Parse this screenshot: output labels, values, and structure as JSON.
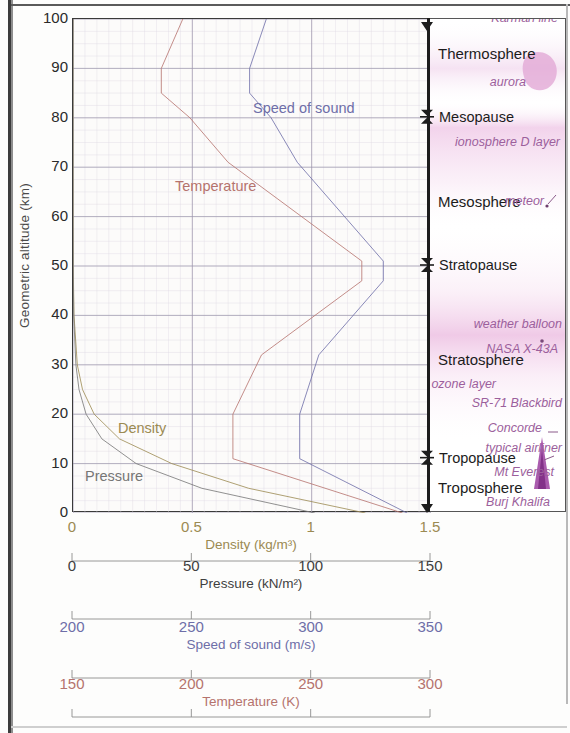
{
  "chart_data": {
    "type": "line",
    "title": "",
    "ylabel": "Geometric altitude (km)",
    "ylim": [
      0,
      100
    ],
    "yticks": [
      0,
      10,
      20,
      30,
      40,
      50,
      60,
      70,
      80,
      90,
      100
    ],
    "grid": true,
    "orientation": "y-is-altitude",
    "legend_position": "in-plot-inline-labels",
    "axes": [
      {
        "name": "density",
        "label": "Density (kg/m³)",
        "ticks": [
          "0",
          "0.5",
          "1",
          "1.5"
        ],
        "tick_values": [
          0,
          0.5,
          1,
          1.5
        ],
        "range": [
          0,
          1.5
        ],
        "color": "#9b8a52"
      },
      {
        "name": "pressure",
        "label": "Pressure (kN/m²)",
        "ticks": [
          "0",
          "50",
          "100",
          "150"
        ],
        "tick_values": [
          0,
          50,
          100,
          150
        ],
        "range": [
          0,
          150
        ],
        "color": "#4a4a4a"
      },
      {
        "name": "speed_of_sound",
        "label": "Speed of sound (m/s)",
        "ticks": [
          "200",
          "250",
          "300",
          "350"
        ],
        "tick_values": [
          200,
          250,
          300,
          350
        ],
        "range": [
          200,
          350
        ],
        "color": "#6e6ea8"
      },
      {
        "name": "temperature",
        "label": "Temperature (K)",
        "ticks": [
          "150",
          "200",
          "250",
          "300"
        ],
        "tick_values": [
          150,
          200,
          250,
          300
        ],
        "range": [
          150,
          300
        ],
        "color": "#b5736d"
      }
    ],
    "series": [
      {
        "name": "Temperature",
        "label": "Temperature",
        "color": "#b5736d",
        "axis": "temperature",
        "unit": "K",
        "altitude_km": [
          0,
          11,
          20,
          32,
          47,
          51,
          71,
          80,
          85,
          90,
          100
        ],
        "values": [
          288,
          217,
          217,
          229,
          271,
          271,
          215,
          199,
          187,
          187,
          196
        ]
      },
      {
        "name": "Speed of sound",
        "label": "Speed of sound",
        "color": "#6e6ea8",
        "axis": "speed_of_sound",
        "unit": "m/s",
        "altitude_km": [
          0,
          11,
          20,
          32,
          47,
          51,
          71,
          80,
          85,
          90,
          100
        ],
        "values": [
          340,
          295,
          295,
          303,
          330,
          330,
          294,
          283,
          274,
          274,
          281
        ]
      },
      {
        "name": "Density",
        "label": "Density",
        "color": "#9b8a52",
        "axis": "density",
        "unit": "kg/m³",
        "altitude_km": [
          0,
          5,
          10,
          15,
          20,
          25,
          30,
          40,
          50,
          60,
          80,
          100
        ],
        "values": [
          1.225,
          0.736,
          0.414,
          0.195,
          0.089,
          0.04,
          0.018,
          0.004,
          0.001,
          0.0003,
          2e-05,
          0.0
        ]
      },
      {
        "name": "Pressure",
        "label": "Pressure",
        "color": "#767676",
        "axis": "pressure",
        "unit": "kN/m²",
        "altitude_km": [
          0,
          5,
          10,
          15,
          20,
          25,
          30,
          40,
          50,
          60,
          80,
          100
        ],
        "values": [
          101.3,
          54.0,
          26.5,
          12.1,
          5.5,
          2.5,
          1.2,
          0.29,
          0.08,
          0.02,
          0.001,
          0.0
        ]
      }
    ]
  },
  "plot": {
    "yaxis_title": "Geometric altitude (km)",
    "yticks": [
      "0",
      "10",
      "20",
      "30",
      "40",
      "50",
      "60",
      "70",
      "80",
      "90",
      "100"
    ],
    "series_labels": {
      "speed_of_sound": "Speed of sound",
      "temperature": "Temperature",
      "density": "Density",
      "pressure": "Pressure"
    }
  },
  "layers": {
    "names": [
      {
        "label": "Thermosphere",
        "altitude_km": 93
      },
      {
        "label": "Mesosphere",
        "altitude_km": 63
      },
      {
        "label": "Stratosphere",
        "altitude_km": 31
      },
      {
        "label": "Troposphere",
        "altitude_km": 5
      }
    ],
    "boundaries": [
      {
        "label": "Mesopause",
        "altitude_km": 80
      },
      {
        "label": "Stratopause",
        "altitude_km": 50
      },
      {
        "label": "Tropopause",
        "altitude_km": 11
      }
    ],
    "annotations": [
      {
        "label": "Kármán line",
        "altitude_km": 100
      },
      {
        "label": "aurora",
        "altitude_km": 87
      },
      {
        "label": "ionosphere D layer",
        "altitude_km": 75
      },
      {
        "label": "meteor",
        "altitude_km": 63
      },
      {
        "label": "weather balloon",
        "altitude_km": 38
      },
      {
        "label": "NASA X-43A",
        "altitude_km": 33
      },
      {
        "label": "ozone layer",
        "altitude_km": 26
      },
      {
        "label": "SR-71 Blackbird",
        "altitude_km": 22
      },
      {
        "label": "Concorde",
        "altitude_km": 17
      },
      {
        "label": "typical airliner",
        "altitude_km": 13
      },
      {
        "label": "Mt Everest",
        "altitude_km": 8
      },
      {
        "label": "Burj Khalifa",
        "altitude_km": 2
      }
    ]
  },
  "bottom_axes": [
    {
      "caption": "Density (kg/m³)",
      "ticks": [
        "0",
        "0.5",
        "1",
        "1.5"
      ],
      "color": "#9b8a52"
    },
    {
      "caption": "Pressure (kN/m²)",
      "ticks": [
        "0",
        "50",
        "100",
        "150"
      ],
      "color": "#3f3f3f"
    },
    {
      "caption": "Speed of sound (m/s)",
      "ticks": [
        "200",
        "250",
        "300",
        "350"
      ],
      "color": "#6e6ea8"
    },
    {
      "caption": "Temperature (K)",
      "ticks": [
        "150",
        "200",
        "250",
        "300"
      ],
      "color": "#b5736d"
    }
  ],
  "colors": {
    "temperature": "#b5736d",
    "speed_of_sound": "#6e6ea8",
    "density": "#9b8a52",
    "pressure": "#767676",
    "annotation": "#9c5f9c",
    "haze": "#e8b9dd"
  }
}
